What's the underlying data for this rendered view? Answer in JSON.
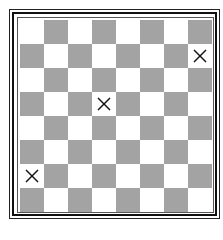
{
  "board": {
    "rows": 8,
    "cols": 8,
    "top_left_color": "light",
    "colors": {
      "light": "#ffffff",
      "dark": "#a9a9a9",
      "frame": "#111111",
      "mark": "#111111"
    },
    "marks": [
      {
        "row": 1,
        "col": 7,
        "symbol": "X",
        "icon": "x-mark-icon"
      },
      {
        "row": 3,
        "col": 3,
        "symbol": "X",
        "icon": "x-mark-icon"
      },
      {
        "row": 6,
        "col": 0,
        "symbol": "X",
        "icon": "x-mark-icon"
      }
    ]
  }
}
